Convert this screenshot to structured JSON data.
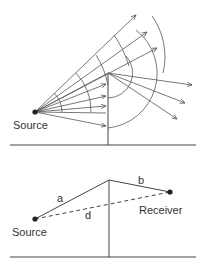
{
  "figure": {
    "top_diagram": {
      "title": "Diffraction of wavefronts over a barrier",
      "source_label": "Source"
    },
    "bottom_diagram": {
      "title": "Path difference geometry",
      "source_label": "Source",
      "receiver_label": "Receiver",
      "segment_a_label": "a",
      "segment_b_label": "b",
      "segment_d_label": "d"
    },
    "colors": {
      "line": "#444444",
      "text": "#333333",
      "background": "#ffffff"
    }
  }
}
